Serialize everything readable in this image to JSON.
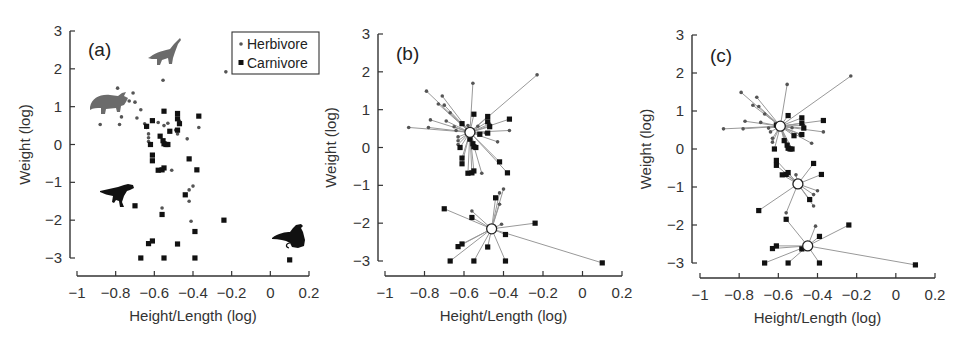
{
  "chart_data": [
    {
      "type": "scatter",
      "panel": "(a)",
      "xlabel": "Height/Length (log)",
      "ylabel": "Weight (log)",
      "xlim": [
        -1,
        0.2
      ],
      "ylim": [
        -3,
        3
      ],
      "xticks": [
        -1,
        -0.8,
        -0.6,
        -0.4,
        -0.2,
        0,
        0.2
      ],
      "xtick_labels": [
        "−1",
        "−0.8",
        "−0.6",
        "−0.4",
        "−0.2",
        "0",
        "0.2"
      ],
      "yticks": [
        3,
        2,
        1,
        0,
        -1,
        -2,
        -3
      ],
      "ytick_labels": [
        "3",
        "2",
        "1",
        "0",
        "−1",
        "−2",
        "−3"
      ],
      "grid": false,
      "legend": {
        "position": "upper right",
        "entries": [
          "Herbivore",
          "Carnivore"
        ]
      },
      "series": [
        {
          "name": "Herbivore",
          "marker": "small-dot",
          "color": "#555555",
          "points": [
            [
              -0.555,
              1.7
            ],
            [
              -0.23,
              1.92
            ],
            [
              -0.79,
              1.49
            ],
            [
              -0.71,
              1.36
            ],
            [
              -0.73,
              1.15
            ],
            [
              -0.7,
              1.12
            ],
            [
              -0.77,
              0.73
            ],
            [
              -0.88,
              0.53
            ],
            [
              -0.78,
              0.53
            ],
            [
              -0.67,
              0.92
            ],
            [
              -0.69,
              0.7
            ],
            [
              -0.65,
              0.55
            ],
            [
              -0.64,
              0.45
            ],
            [
              -0.63,
              0.28
            ],
            [
              -0.63,
              0.18
            ],
            [
              -0.63,
              0.08
            ],
            [
              -0.58,
              0.58
            ],
            [
              -0.55,
              0.5
            ],
            [
              -0.53,
              0.56
            ],
            [
              -0.49,
              0.38
            ],
            [
              -0.48,
              0.28
            ],
            [
              -0.47,
              0.62
            ],
            [
              -0.43,
              0.15
            ],
            [
              -0.37,
              0.45
            ],
            [
              -0.51,
              -0.68
            ],
            [
              -0.4,
              -1.1
            ],
            [
              -0.42,
              -1.2
            ],
            [
              -0.42,
              -1.5
            ],
            [
              -0.56,
              -1.68
            ],
            [
              -0.41,
              -2.03
            ]
          ]
        },
        {
          "name": "Carnivore",
          "marker": "square",
          "color": "#111111",
          "points": [
            [
              -0.55,
              0.88
            ],
            [
              -0.48,
              0.82
            ],
            [
              -0.61,
              0.63
            ],
            [
              -0.48,
              0.68
            ],
            [
              -0.37,
              0.75
            ],
            [
              -0.64,
              0.48
            ],
            [
              -0.47,
              0.55
            ],
            [
              -0.52,
              0.35
            ],
            [
              -0.48,
              0.38
            ],
            [
              -0.57,
              0.22
            ],
            [
              -0.555,
              0.1
            ],
            [
              -0.55,
              0.02
            ],
            [
              -0.54,
              0.0
            ],
            [
              -0.53,
              0.0
            ],
            [
              -0.62,
              0.0
            ],
            [
              -0.61,
              -0.28
            ],
            [
              -0.61,
              -0.43
            ],
            [
              -0.58,
              -0.68
            ],
            [
              -0.56,
              -0.67
            ],
            [
              -0.55,
              -0.62
            ],
            [
              -0.42,
              -0.38
            ],
            [
              -0.38,
              -0.67
            ],
            [
              -0.44,
              -1.33
            ],
            [
              -0.7,
              -1.62
            ],
            [
              -0.56,
              -1.85
            ],
            [
              -0.24,
              -2.0
            ],
            [
              -0.39,
              -2.3
            ],
            [
              -0.61,
              -2.55
            ],
            [
              -0.63,
              -2.62
            ],
            [
              -0.48,
              -2.63
            ],
            [
              -0.67,
              -3.0
            ],
            [
              -0.55,
              -3.0
            ],
            [
              -0.39,
              -3.0
            ],
            [
              0.1,
              -3.05
            ]
          ]
        }
      ],
      "annotations": [
        "Brachiosaurus silhouette near (-0.55, 2.4)",
        "Triceratops silhouette near (-0.85, 1.1)",
        "Tyrannosaur silhouette near (-0.8, -1.3)",
        "Bird silhouette near (0.15, -2.6)"
      ]
    },
    {
      "type": "scatter",
      "panel": "(b)",
      "description": "Two-cluster assignment; each point connected by a line to its cluster centroid (open circle)",
      "xlabel": "Height/Length (log)",
      "ylabel": "Weight (log)",
      "xlim": [
        -1,
        0.2
      ],
      "ylim": [
        -3,
        3
      ],
      "xticks": [
        -1,
        -0.8,
        -0.6,
        -0.4,
        -0.2,
        0,
        0.2
      ],
      "xtick_labels": [
        "−1",
        "−0.8",
        "−0.6",
        "−0.4",
        "−0.2",
        "0",
        "0.2"
      ],
      "yticks": [
        3,
        2,
        1,
        0,
        -1,
        -2,
        -3
      ],
      "ytick_labels": [
        "3",
        "2",
        "1",
        "0",
        "−1",
        "−2",
        "−3"
      ],
      "grid": false,
      "centroids": [
        [
          -0.57,
          0.4
        ],
        [
          -0.46,
          -2.15
        ]
      ],
      "clusters": [
        {
          "centroid_index": 0,
          "points": [
            [
              -0.555,
              1.7
            ],
            [
              -0.23,
              1.92
            ],
            [
              -0.79,
              1.49
            ],
            [
              -0.71,
              1.36
            ],
            [
              -0.73,
              1.15
            ],
            [
              -0.7,
              1.12
            ],
            [
              -0.77,
              0.73
            ],
            [
              -0.88,
              0.53
            ],
            [
              -0.78,
              0.53
            ],
            [
              -0.67,
              0.92
            ],
            [
              -0.69,
              0.7
            ],
            [
              -0.65,
              0.55
            ],
            [
              -0.64,
              0.45
            ],
            [
              -0.63,
              0.28
            ],
            [
              -0.63,
              0.18
            ],
            [
              -0.63,
              0.08
            ],
            [
              -0.58,
              0.58
            ],
            [
              -0.53,
              0.56
            ],
            [
              -0.49,
              0.38
            ],
            [
              -0.47,
              0.62
            ],
            [
              -0.43,
              0.15
            ],
            [
              -0.37,
              0.45
            ],
            [
              -0.51,
              -0.68
            ],
            [
              -0.55,
              0.88
            ],
            [
              -0.48,
              0.82
            ],
            [
              -0.61,
              0.63
            ],
            [
              -0.48,
              0.68
            ],
            [
              -0.37,
              0.75
            ],
            [
              -0.47,
              0.55
            ],
            [
              -0.52,
              0.35
            ],
            [
              -0.48,
              0.38
            ],
            [
              -0.57,
              0.22
            ],
            [
              -0.555,
              0.1
            ],
            [
              -0.55,
              0.02
            ],
            [
              -0.54,
              0.0
            ],
            [
              -0.62,
              0.0
            ],
            [
              -0.61,
              -0.28
            ],
            [
              -0.61,
              -0.43
            ],
            [
              -0.58,
              -0.68
            ],
            [
              -0.56,
              -0.67
            ],
            [
              -0.55,
              -0.62
            ],
            [
              -0.42,
              -0.38
            ],
            [
              -0.38,
              -0.67
            ]
          ]
        },
        {
          "centroid_index": 1,
          "points": [
            [
              -0.4,
              -1.1
            ],
            [
              -0.42,
              -1.2
            ],
            [
              -0.42,
              -1.5
            ],
            [
              -0.56,
              -1.68
            ],
            [
              -0.41,
              -2.03
            ],
            [
              -0.44,
              -1.33
            ],
            [
              -0.7,
              -1.62
            ],
            [
              -0.56,
              -1.85
            ],
            [
              -0.24,
              -2.0
            ],
            [
              -0.39,
              -2.3
            ],
            [
              -0.61,
              -2.55
            ],
            [
              -0.63,
              -2.62
            ],
            [
              -0.48,
              -2.63
            ],
            [
              -0.67,
              -3.0
            ],
            [
              -0.55,
              -3.0
            ],
            [
              -0.39,
              -3.0
            ],
            [
              0.1,
              -3.05
            ]
          ]
        }
      ]
    },
    {
      "type": "scatter",
      "panel": "(c)",
      "description": "Three-cluster assignment; each point connected by a line to its cluster centroid (open circle)",
      "xlabel": "Height/Length (log)",
      "ylabel": "Weight (log)",
      "xlim": [
        -1,
        0.2
      ],
      "ylim": [
        -3,
        3
      ],
      "xticks": [
        -1,
        -0.8,
        -0.6,
        -0.4,
        -0.2,
        0,
        0.2
      ],
      "xtick_labels": [
        "−1",
        "−0.8",
        "−0.6",
        "−0.4",
        "−0.2",
        "0",
        "0.2"
      ],
      "yticks": [
        3,
        2,
        1,
        0,
        -1,
        -2,
        -3
      ],
      "ytick_labels": [
        "3",
        "2",
        "1",
        "0",
        "−1",
        "−2",
        "−3"
      ],
      "grid": false,
      "centroids": [
        [
          -0.59,
          0.6
        ],
        [
          -0.5,
          -0.92
        ],
        [
          -0.45,
          -2.55
        ]
      ],
      "clusters": [
        {
          "centroid_index": 0,
          "points": [
            [
              -0.555,
              1.7
            ],
            [
              -0.23,
              1.92
            ],
            [
              -0.79,
              1.49
            ],
            [
              -0.71,
              1.36
            ],
            [
              -0.73,
              1.15
            ],
            [
              -0.7,
              1.12
            ],
            [
              -0.77,
              0.73
            ],
            [
              -0.88,
              0.53
            ],
            [
              -0.78,
              0.53
            ],
            [
              -0.67,
              0.92
            ],
            [
              -0.69,
              0.7
            ],
            [
              -0.65,
              0.55
            ],
            [
              -0.64,
              0.45
            ],
            [
              -0.63,
              0.28
            ],
            [
              -0.63,
              0.18
            ],
            [
              -0.58,
              0.58
            ],
            [
              -0.53,
              0.56
            ],
            [
              -0.49,
              0.38
            ],
            [
              -0.47,
              0.62
            ],
            [
              -0.43,
              0.15
            ],
            [
              -0.37,
              0.45
            ],
            [
              -0.55,
              0.88
            ],
            [
              -0.48,
              0.82
            ],
            [
              -0.61,
              0.63
            ],
            [
              -0.48,
              0.68
            ],
            [
              -0.37,
              0.75
            ],
            [
              -0.47,
              0.55
            ],
            [
              -0.52,
              0.35
            ],
            [
              -0.48,
              0.38
            ],
            [
              -0.57,
              0.22
            ],
            [
              -0.555,
              0.1
            ],
            [
              -0.55,
              0.02
            ],
            [
              -0.54,
              0.0
            ],
            [
              -0.53,
              0.0
            ],
            [
              -0.62,
              0.0
            ]
          ]
        },
        {
          "centroid_index": 1,
          "points": [
            [
              -0.61,
              -0.3
            ],
            [
              -0.61,
              -0.43
            ],
            [
              -0.58,
              -0.68
            ],
            [
              -0.56,
              -0.67
            ],
            [
              -0.55,
              -0.62
            ],
            [
              -0.51,
              -0.68
            ],
            [
              -0.42,
              -0.38
            ],
            [
              -0.38,
              -0.67
            ],
            [
              -0.4,
              -1.1
            ],
            [
              -0.42,
              -1.2
            ],
            [
              -0.44,
              -1.33
            ],
            [
              -0.42,
              -1.5
            ],
            [
              -0.7,
              -1.62
            ],
            [
              -0.56,
              -1.68
            ]
          ]
        },
        {
          "centroid_index": 2,
          "points": [
            [
              -0.56,
              -1.85
            ],
            [
              -0.41,
              -2.03
            ],
            [
              -0.24,
              -2.0
            ],
            [
              -0.39,
              -2.3
            ],
            [
              -0.61,
              -2.55
            ],
            [
              -0.63,
              -2.62
            ],
            [
              -0.48,
              -2.63
            ],
            [
              -0.67,
              -3.0
            ],
            [
              -0.55,
              -3.0
            ],
            [
              -0.39,
              -3.0
            ],
            [
              0.1,
              -3.05
            ]
          ]
        }
      ]
    }
  ],
  "panels": [
    {
      "label": "(a)",
      "xlabel": "Height/Length (log)",
      "ylabel": "Weight (log)"
    },
    {
      "label": "(b)",
      "xlabel": "Height/Length (log)",
      "ylabel": "Weight (log)"
    },
    {
      "label": "(c)",
      "xlabel": "Height/Length (log)",
      "ylabel": "Weight (log)"
    }
  ],
  "legend": {
    "herbivore": "Herbivore",
    "carnivore": "Carnivore"
  },
  "colors": {
    "axis": "#333333",
    "herbivore": "#555555",
    "carnivore": "#111111",
    "link": "#999999",
    "centroid_fill": "#ffffff",
    "silhouette_gray": "#6b6b6b",
    "silhouette_black": "#111111"
  }
}
